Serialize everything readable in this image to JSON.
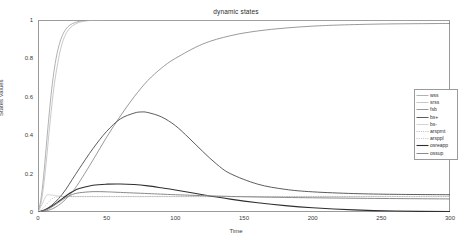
{
  "chart_data": {
    "type": "line",
    "title": "dynamic states",
    "xlabel": "Time",
    "ylabel": "States Values",
    "xlim": [
      0,
      300
    ],
    "ylim": [
      0,
      1
    ],
    "xticks": [
      0,
      50,
      100,
      150,
      200,
      250,
      300
    ],
    "yticks": [
      0,
      0.2,
      0.4,
      0.6,
      0.8,
      1
    ],
    "grid": false,
    "legend_position": "right",
    "background": "#ffffff",
    "axis_color": "#9a9a9a",
    "series": [
      {
        "name": "wss",
        "color": "#8f8f8f",
        "width": 0.7,
        "dash": "none",
        "x": [
          0,
          2,
          4,
          6,
          8,
          10,
          12,
          14,
          16,
          18,
          20,
          22,
          25,
          30,
          35,
          40,
          50,
          60,
          80,
          100,
          150,
          200,
          250,
          300
        ],
        "values": [
          0.0,
          0.06,
          0.18,
          0.34,
          0.5,
          0.64,
          0.75,
          0.83,
          0.885,
          0.924,
          0.949,
          0.966,
          0.981,
          0.993,
          0.9975,
          0.999,
          1.0,
          1.0,
          1.0,
          1.0,
          1.0,
          1.0,
          1.0,
          1.0
        ]
      },
      {
        "name": "srss",
        "color": "#b0b0b0",
        "width": 0.7,
        "dash": "none",
        "x": [
          0,
          2,
          4,
          6,
          8,
          10,
          12,
          14,
          16,
          18,
          20,
          22,
          25,
          30,
          35,
          40,
          50,
          60,
          80,
          100,
          150,
          200,
          250,
          300
        ],
        "values": [
          0.0,
          0.04,
          0.13,
          0.26,
          0.41,
          0.55,
          0.67,
          0.76,
          0.835,
          0.887,
          0.923,
          0.947,
          0.969,
          0.988,
          0.995,
          0.998,
          0.9995,
          1.0,
          1.0,
          1.0,
          1.0,
          1.0,
          1.0,
          1.0
        ]
      },
      {
        "name": "fsb",
        "color": "#6e6e6e",
        "width": 0.7,
        "dash": "none",
        "x": [
          0,
          5,
          10,
          15,
          20,
          25,
          30,
          40,
          50,
          60,
          70,
          80,
          90,
          100,
          120,
          140,
          160,
          180,
          200,
          220,
          250,
          280,
          300
        ],
        "values": [
          0.0,
          0.004,
          0.015,
          0.035,
          0.065,
          0.105,
          0.155,
          0.27,
          0.39,
          0.5,
          0.6,
          0.685,
          0.75,
          0.8,
          0.875,
          0.918,
          0.943,
          0.958,
          0.968,
          0.974,
          0.979,
          0.981,
          0.982
        ]
      },
      {
        "name": "bs+",
        "color": "#4a4a4a",
        "width": 0.9,
        "dash": "none",
        "x": [
          0,
          5,
          10,
          15,
          20,
          25,
          30,
          40,
          50,
          60,
          70,
          75,
          80,
          90,
          100,
          110,
          120,
          130,
          140,
          160,
          180,
          200,
          230,
          260,
          300
        ],
        "values": [
          0.0,
          0.012,
          0.035,
          0.07,
          0.115,
          0.17,
          0.225,
          0.33,
          0.42,
          0.485,
          0.515,
          0.521,
          0.518,
          0.495,
          0.45,
          0.385,
          0.315,
          0.25,
          0.2,
          0.145,
          0.118,
          0.105,
          0.096,
          0.092,
          0.09
        ]
      },
      {
        "name": "bs-",
        "color": "#c2c2c2",
        "width": 0.7,
        "dash": "none",
        "x": [
          0,
          3,
          6,
          9,
          12,
          15,
          18,
          22,
          26,
          30,
          40,
          60,
          100,
          150,
          200,
          250,
          300
        ],
        "values": [
          0.0,
          0.04,
          0.085,
          0.089,
          0.086,
          0.083,
          0.081,
          0.08,
          0.08,
          0.08,
          0.08,
          0.08,
          0.08,
          0.08,
          0.08,
          0.08,
          0.08
        ]
      },
      {
        "name": "arspmt",
        "color": "#9c9c9c",
        "width": 0.6,
        "dash": "dotted",
        "x": [
          0,
          5,
          10,
          15,
          20,
          25,
          30,
          40,
          60,
          100,
          150,
          200,
          250,
          300
        ],
        "values": [
          0.0,
          0.03,
          0.068,
          0.08,
          0.081,
          0.081,
          0.081,
          0.081,
          0.081,
          0.081,
          0.081,
          0.081,
          0.081,
          0.081
        ]
      },
      {
        "name": "arsppl",
        "color": "#a8a8a8",
        "width": 0.6,
        "dash": "dotted",
        "x": [
          0,
          2,
          5,
          10,
          20,
          50,
          100,
          150,
          200,
          250,
          300
        ],
        "values": [
          1.0,
          1.0,
          1.0,
          1.0,
          1.0,
          1.0,
          1.0,
          1.0,
          1.0,
          1.0,
          1.0
        ]
      },
      {
        "name": "osreapp",
        "color": "#2f2f2f",
        "width": 1.1,
        "dash": "none",
        "x": [
          0,
          5,
          10,
          15,
          20,
          25,
          30,
          40,
          50,
          60,
          70,
          80,
          90,
          100,
          120,
          140,
          160,
          180,
          200,
          230,
          260,
          300
        ],
        "values": [
          0.0,
          0.01,
          0.03,
          0.055,
          0.082,
          0.105,
          0.122,
          0.139,
          0.145,
          0.146,
          0.143,
          0.136,
          0.126,
          0.115,
          0.09,
          0.067,
          0.048,
          0.033,
          0.022,
          0.011,
          0.005,
          0.002
        ]
      },
      {
        "name": "ossup",
        "color": "#8a8a8a",
        "width": 1.0,
        "dash": "none",
        "x": [
          0,
          5,
          10,
          15,
          20,
          25,
          30,
          40,
          50,
          60,
          80,
          100,
          130,
          160,
          200,
          240,
          280,
          300
        ],
        "values": [
          0.0,
          0.008,
          0.026,
          0.05,
          0.074,
          0.091,
          0.1,
          0.106,
          0.105,
          0.102,
          0.096,
          0.09,
          0.083,
          0.078,
          0.074,
          0.071,
          0.069,
          0.068
        ]
      }
    ]
  }
}
